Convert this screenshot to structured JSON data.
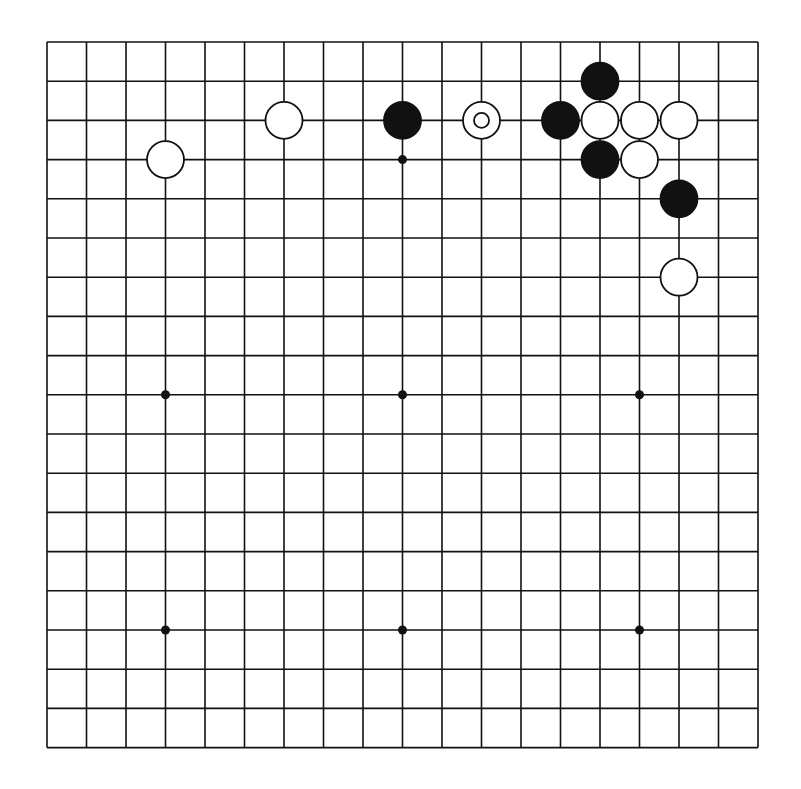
{
  "board": {
    "size": 19,
    "origin_x": 47,
    "origin_y": 42,
    "spacing_x": 39.5,
    "spacing_y": 39.2,
    "line_color": "#111111",
    "background": "#ffffff"
  },
  "star_points": [
    [
      3,
      3
    ],
    [
      9,
      3
    ],
    [
      15,
      3
    ],
    [
      3,
      9
    ],
    [
      9,
      9
    ],
    [
      15,
      9
    ],
    [
      3,
      15
    ],
    [
      9,
      15
    ],
    [
      15,
      15
    ]
  ],
  "stones": [
    {
      "color": "white",
      "col": 3,
      "row": 3
    },
    {
      "color": "white",
      "col": 6,
      "row": 2
    },
    {
      "color": "black",
      "col": 9,
      "row": 2
    },
    {
      "color": "white",
      "col": 11,
      "row": 2,
      "marker": "circle"
    },
    {
      "color": "black",
      "col": 13,
      "row": 2
    },
    {
      "color": "black",
      "col": 14,
      "row": 1
    },
    {
      "color": "white",
      "col": 14,
      "row": 2
    },
    {
      "color": "white",
      "col": 15,
      "row": 2
    },
    {
      "color": "white",
      "col": 16,
      "row": 2
    },
    {
      "color": "black",
      "col": 14,
      "row": 3
    },
    {
      "color": "white",
      "col": 15,
      "row": 3
    },
    {
      "color": "black",
      "col": 16,
      "row": 4
    },
    {
      "color": "white",
      "col": 16,
      "row": 6
    }
  ]
}
